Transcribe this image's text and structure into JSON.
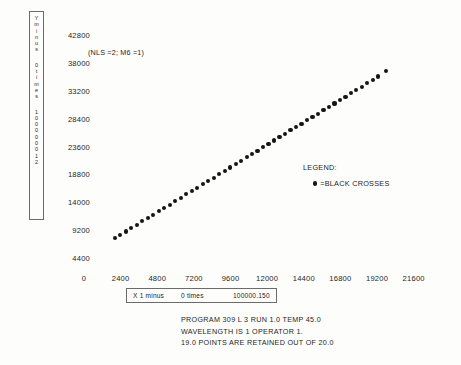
{
  "chart_data": {
    "type": "scatter",
    "title": "",
    "annotation": "(NLS =2; M6 =1)",
    "xlabel": "X 1 minus 0 times 100000.150",
    "ylabel": "Y minus 0 times 100000012",
    "xlim": [
      0,
      22800
    ],
    "ylim": [
      2000,
      45200
    ],
    "xticks": [
      "0",
      "2400",
      "4800",
      "7200",
      "9600",
      "12000",
      "14400",
      "16800",
      "19200",
      "21600"
    ],
    "yticks": [
      "42800",
      "38000",
      "33200",
      "28400",
      "23600",
      "18800",
      "14000",
      "9200",
      "4400"
    ],
    "grid": false,
    "legend_position": "center-right",
    "series": [
      {
        "name": "BLACK CROSSES",
        "marker": "filled-circle",
        "color": "#151515",
        "points": [
          [
            2010,
            7980
          ],
          [
            2370,
            8560
          ],
          [
            2730,
            9140
          ],
          [
            3090,
            9720
          ],
          [
            3450,
            10300
          ],
          [
            3810,
            10880
          ],
          [
            4170,
            11460
          ],
          [
            4530,
            12040
          ],
          [
            4890,
            12620
          ],
          [
            5250,
            13200
          ],
          [
            5610,
            13780
          ],
          [
            5970,
            14360
          ],
          [
            6330,
            14940
          ],
          [
            6690,
            15520
          ],
          [
            7050,
            16100
          ],
          [
            7410,
            16680
          ],
          [
            7770,
            17260
          ],
          [
            8130,
            17840
          ],
          [
            8490,
            18420
          ],
          [
            8850,
            19000
          ],
          [
            9210,
            19580
          ],
          [
            9570,
            20160
          ],
          [
            9930,
            20740
          ],
          [
            10290,
            21320
          ],
          [
            10650,
            21900
          ],
          [
            11010,
            22480
          ],
          [
            11370,
            23060
          ],
          [
            11730,
            23640
          ],
          [
            12090,
            24220
          ],
          [
            12450,
            24800
          ],
          [
            12810,
            25380
          ],
          [
            13170,
            25960
          ],
          [
            13530,
            26540
          ],
          [
            13890,
            27120
          ],
          [
            14250,
            27700
          ],
          [
            14610,
            28280
          ],
          [
            14970,
            28860
          ],
          [
            15330,
            29440
          ],
          [
            15690,
            30020
          ],
          [
            16050,
            30600
          ],
          [
            16410,
            31180
          ],
          [
            16770,
            31760
          ],
          [
            17130,
            32340
          ],
          [
            17490,
            32920
          ],
          [
            17850,
            33500
          ],
          [
            18210,
            34080
          ],
          [
            18570,
            34660
          ],
          [
            18930,
            35240
          ],
          [
            19290,
            35820
          ],
          [
            19800,
            36800
          ]
        ]
      }
    ]
  },
  "yaxis": {
    "caption_lines": [
      "Y",
      "m",
      "i",
      "n",
      "u",
      "s",
      "0",
      "t",
      "i",
      "m",
      "e",
      "s",
      "1",
      "0",
      "0",
      "0",
      "0",
      "0",
      "0",
      "1",
      "2"
    ],
    "caption_groups": [
      [
        "Y",
        "m",
        "i",
        "n",
        "u",
        "s"
      ],
      [
        "0",
        "t",
        "i",
        "m",
        "e",
        "s"
      ],
      [
        "1",
        "0",
        "0",
        "0",
        "0",
        "0",
        "0",
        "1",
        "2"
      ]
    ]
  },
  "xaxis": {
    "caption_part1": "X 1 minus",
    "caption_part2": "0 times",
    "caption_part3": "100000.150"
  },
  "legend": {
    "title": "LEGEND:",
    "entry": "=BLACK CROSSES"
  },
  "footer": {
    "line1": "PROGRAM 309 L 3 RUN 1.0  TEMP 45.0",
    "line2": "WAVELENGTH IS 1 OPERATOR    1.",
    "line3": "19.0 POINTS ARE RETAINED OUT OF 20.0"
  }
}
